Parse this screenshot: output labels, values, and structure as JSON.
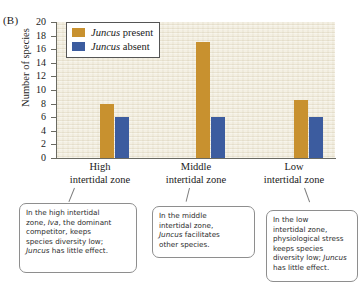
{
  "figure": {
    "panel_letter": "(B)"
  },
  "chart_data": {
    "type": "bar",
    "title": "",
    "xlabel": "",
    "ylabel": "Number of species",
    "ylim": [
      0,
      20
    ],
    "ytick_step": 2,
    "yticks": [
      0,
      2,
      4,
      6,
      8,
      10,
      12,
      14,
      16,
      18,
      20
    ],
    "grid": false,
    "legend_position": "top-left inside plot",
    "categories": [
      "High intertidal zone",
      "Middle intertidal zone",
      "Low intertidal zone"
    ],
    "category_lines": [
      [
        "High",
        "intertidal zone"
      ],
      [
        "Middle",
        "intertidal zone"
      ],
      [
        "Low",
        "intertidal zone"
      ]
    ],
    "series": [
      {
        "name": "Juncus present",
        "name_italic_part": "Juncus",
        "name_rest": " present",
        "color": "#c8912f",
        "values": [
          8,
          17,
          8.5
        ]
      },
      {
        "name": "Juncus absent",
        "name_italic_part": "Juncus",
        "name_rest": " absent",
        "color": "#3c5c9f",
        "values": [
          6,
          6,
          6
        ]
      }
    ]
  },
  "callouts": [
    {
      "id": "high",
      "lines": [
        "In the high intertidal",
        "zone, Iva, the dominant",
        "competitor, keeps",
        "species diversity low;",
        "Juncus has little effect."
      ],
      "text": "In the high intertidal zone, Iva, the dominant competitor, keeps species diversity low; Juncus has little effect."
    },
    {
      "id": "middle",
      "lines": [
        "In the middle",
        "intertidal zone,",
        "Juncus facilitates",
        "other species."
      ],
      "text": "In the middle intertidal zone, Juncus facilitates other species."
    },
    {
      "id": "low",
      "lines": [
        "In the low",
        "intertidal zone,",
        "physiological stress",
        "keeps species",
        "diversity low; Juncus",
        "has little effect."
      ],
      "text": "In the low intertidal zone, physiological stress keeps species diversity low; Juncus has little effect."
    }
  ]
}
